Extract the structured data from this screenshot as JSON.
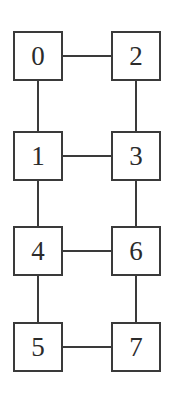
{
  "diagram": {
    "type": "graph",
    "title": "",
    "background_color": "#ffffff",
    "node_border_color": "#3a3a3a",
    "node_fill_color": "#ffffff",
    "edge_color": "#3a3a3a",
    "label_color": "#2b2b2b",
    "nodes": [
      {
        "id": "0",
        "label": "0",
        "row": 0,
        "col": 0,
        "x": 13,
        "y": 31
      },
      {
        "id": "2",
        "label": "2",
        "row": 0,
        "col": 1,
        "x": 111,
        "y": 31
      },
      {
        "id": "1",
        "label": "1",
        "row": 1,
        "col": 0,
        "x": 13,
        "y": 131
      },
      {
        "id": "3",
        "label": "3",
        "row": 1,
        "col": 1,
        "x": 111,
        "y": 131
      },
      {
        "id": "4",
        "label": "4",
        "row": 2,
        "col": 0,
        "x": 13,
        "y": 226
      },
      {
        "id": "6",
        "label": "6",
        "row": 2,
        "col": 1,
        "x": 111,
        "y": 226
      },
      {
        "id": "5",
        "label": "5",
        "row": 3,
        "col": 0,
        "x": 13,
        "y": 322
      },
      {
        "id": "7",
        "label": "7",
        "row": 3,
        "col": 1,
        "x": 111,
        "y": 322
      }
    ],
    "edges": [
      {
        "from": "0",
        "to": "2",
        "orientation": "horizontal",
        "x": 63,
        "y": 55,
        "length": 48
      },
      {
        "from": "1",
        "to": "3",
        "orientation": "horizontal",
        "x": 63,
        "y": 155,
        "length": 48
      },
      {
        "from": "4",
        "to": "6",
        "orientation": "horizontal",
        "x": 63,
        "y": 250,
        "length": 48
      },
      {
        "from": "5",
        "to": "7",
        "orientation": "horizontal",
        "x": 63,
        "y": 346,
        "length": 48
      },
      {
        "from": "0",
        "to": "1",
        "orientation": "vertical",
        "x": 37,
        "y": 81,
        "length": 50
      },
      {
        "from": "1",
        "to": "4",
        "orientation": "vertical",
        "x": 37,
        "y": 181,
        "length": 45
      },
      {
        "from": "4",
        "to": "5",
        "orientation": "vertical",
        "x": 37,
        "y": 276,
        "length": 46
      },
      {
        "from": "2",
        "to": "3",
        "orientation": "vertical",
        "x": 135,
        "y": 81,
        "length": 50
      },
      {
        "from": "3",
        "to": "6",
        "orientation": "vertical",
        "x": 135,
        "y": 181,
        "length": 45
      },
      {
        "from": "6",
        "to": "7",
        "orientation": "vertical",
        "x": 135,
        "y": 276,
        "length": 46
      }
    ]
  }
}
